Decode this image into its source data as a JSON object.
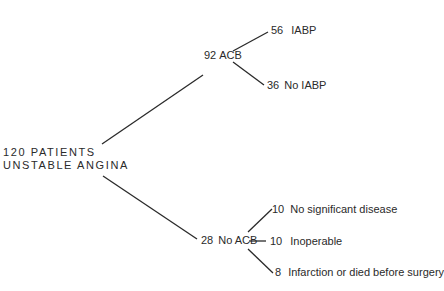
{
  "diagram": {
    "type": "tree",
    "root": {
      "line1": "120 PATIENTS",
      "line2": "UNSTABLE ANGINA"
    },
    "branches": [
      {
        "count": "92",
        "label": "ACB",
        "children": [
          {
            "count": "56",
            "label": "IABP"
          },
          {
            "count": "36",
            "label": "No IABP"
          }
        ]
      },
      {
        "count": "28",
        "label": "No ACB",
        "children": [
          {
            "count": "10",
            "label": "No significant disease"
          },
          {
            "count": "10",
            "label": "Inoperable"
          },
          {
            "count": "8",
            "label": "Infarction or died before surgery"
          }
        ]
      }
    ]
  }
}
